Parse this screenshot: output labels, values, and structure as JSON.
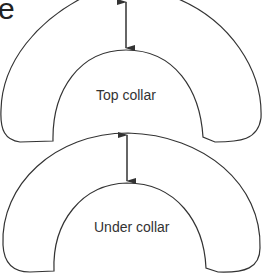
{
  "diagram": {
    "partial_text": "e",
    "labels": {
      "top": "Top collar",
      "under": "Under collar"
    },
    "colors": {
      "stroke": "#333333",
      "background": "#ffffff"
    },
    "icons": [
      "double-arrow-icon",
      "double-arrow-icon"
    ]
  }
}
